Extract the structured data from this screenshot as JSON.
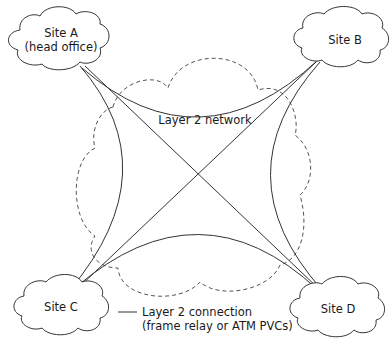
{
  "diagram": {
    "type": "network-topology",
    "network_label": "Layer 2 network",
    "sites": [
      {
        "id": "A",
        "label_line1": "Site A",
        "label_line2": "(head office)"
      },
      {
        "id": "B",
        "label_line1": "Site B"
      },
      {
        "id": "C",
        "label_line1": "Site C"
      },
      {
        "id": "D",
        "label_line1": "Site D"
      }
    ],
    "connections": [
      {
        "from": "A",
        "to": "B"
      },
      {
        "from": "A",
        "to": "C"
      },
      {
        "from": "A",
        "to": "D"
      },
      {
        "from": "B",
        "to": "C"
      },
      {
        "from": "B",
        "to": "D"
      },
      {
        "from": "C",
        "to": "D"
      }
    ],
    "legend": {
      "line1": "Layer 2 connection",
      "line2": "(frame relay or ATM PVCs)"
    },
    "colors": {
      "line": "#333333",
      "dashed_cloud": "#555555",
      "background": "#ffffff"
    }
  }
}
